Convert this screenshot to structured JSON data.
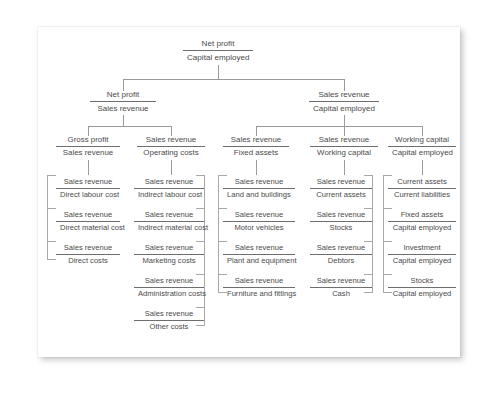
{
  "diagram": {
    "type": "tree",
    "root": {
      "numerator": "Net profit",
      "denominator": "Capital employed"
    },
    "level2": [
      {
        "numerator": "Net profit",
        "denominator": "Sales revenue"
      },
      {
        "numerator": "Sales revenue",
        "denominator": "Capital employed"
      }
    ],
    "level3": [
      {
        "numerator": "Gross profit",
        "denominator": "Sales revenue"
      },
      {
        "numerator": "Sales revenue",
        "denominator": "Operating costs"
      },
      {
        "numerator": "Sales revenue",
        "denominator": "Fixed assets"
      },
      {
        "numerator": "Sales revenue",
        "denominator": "Working capital"
      },
      {
        "numerator": "Working capital",
        "denominator": "Capital employed"
      }
    ],
    "columns": [
      {
        "name": "direct-costs-column",
        "bracket": "left",
        "items": [
          {
            "numerator": "Sales revenue",
            "denominator": "Direct labour cost"
          },
          {
            "numerator": "Sales revenue",
            "denominator": "Direct material cost"
          },
          {
            "numerator": "Sales revenue",
            "denominator": "Direct costs"
          }
        ]
      },
      {
        "name": "operating-costs-column",
        "bracket": "right",
        "items": [
          {
            "numerator": "Sales revenue",
            "denominator": "Indirect labour cost"
          },
          {
            "numerator": "Sales revenue",
            "denominator": "Indirect material cost"
          },
          {
            "numerator": "Sales revenue",
            "denominator": "Marketing costs"
          },
          {
            "numerator": "Sales revenue",
            "denominator": "Administration costs"
          },
          {
            "numerator": "Sales revenue",
            "denominator": "Other costs"
          }
        ]
      },
      {
        "name": "fixed-assets-column",
        "bracket": "left",
        "items": [
          {
            "numerator": "Sales revenue",
            "denominator": "Land and buildings"
          },
          {
            "numerator": "Sales revenue",
            "denominator": "Motor vehicles"
          },
          {
            "numerator": "Sales revenue",
            "denominator": "Plant and equipment"
          },
          {
            "numerator": "Sales revenue",
            "denominator": "Furniture and fittings"
          }
        ]
      },
      {
        "name": "working-capital-column",
        "bracket": "right",
        "items": [
          {
            "numerator": "Sales revenue",
            "denominator": "Current assets"
          },
          {
            "numerator": "Sales revenue",
            "denominator": "Stocks"
          },
          {
            "numerator": "Sales revenue",
            "denominator": "Debtors"
          },
          {
            "numerator": "Sales revenue",
            "denominator": "Cash"
          }
        ]
      },
      {
        "name": "capital-employed-column",
        "bracket": "left",
        "items": [
          {
            "numerator": "Current assets",
            "denominator": "Current liabilities"
          },
          {
            "numerator": "Fixed assets",
            "denominator": "Capital employed"
          },
          {
            "numerator": "Investment",
            "denominator": "Capital employed"
          },
          {
            "numerator": "Stocks",
            "denominator": "Capital employed"
          }
        ]
      }
    ],
    "colors": {
      "text": "#4a4a4a",
      "rule": "#6e6e6e",
      "connector": "#9a9a9a",
      "card": "#ffffff",
      "page": "#ffffff"
    }
  }
}
